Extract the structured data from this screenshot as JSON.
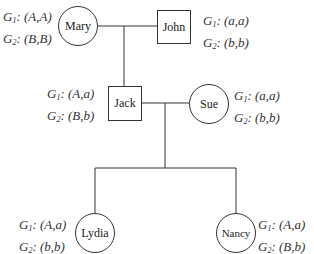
{
  "pedigree": {
    "individuals": {
      "mary": {
        "name": "Mary",
        "shape": "circle",
        "g1": "(A,A)",
        "g2": "(B,B)"
      },
      "john": {
        "name": "John",
        "shape": "square",
        "g1": "(a,a)",
        "g2": "(b,b)"
      },
      "jack": {
        "name": "Jack",
        "shape": "square",
        "g1": "(A,a)",
        "g2": "(B,b)"
      },
      "sue": {
        "name": "Sue",
        "shape": "circle",
        "g1": "(a,a)",
        "g2": "(b,b)"
      },
      "lydia": {
        "name": "Lydia",
        "shape": "circle",
        "g1": "(A,a)",
        "g2": "(b,b)"
      },
      "nancy": {
        "name": "Nancy",
        "shape": "circle",
        "g1": "(A,a)",
        "g2": "(B,b)"
      }
    },
    "labels": {
      "gene_letter": "G",
      "g1_sub": "1",
      "g2_sub": "2"
    },
    "relations": [
      {
        "type": "mating",
        "members": [
          "Mary",
          "John"
        ],
        "children": [
          "Jack"
        ]
      },
      {
        "type": "mating",
        "members": [
          "Jack",
          "Sue"
        ],
        "children": [
          "Lydia",
          "Nancy"
        ]
      }
    ]
  }
}
